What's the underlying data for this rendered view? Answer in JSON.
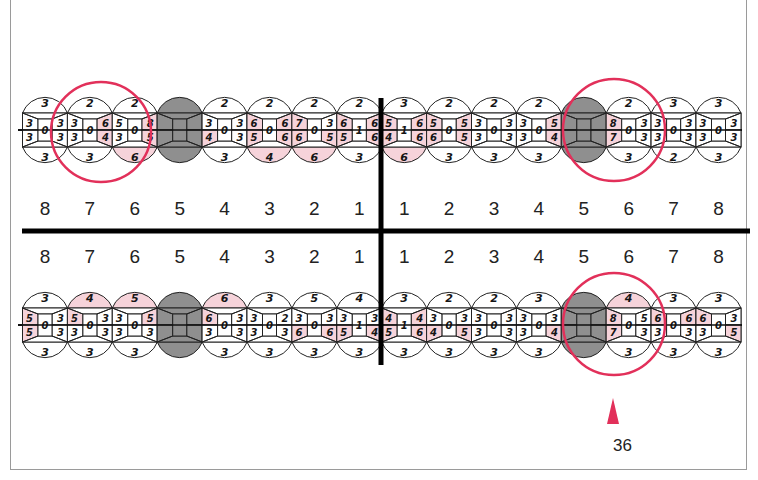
{
  "chart": {
    "type": "periodontal-chart",
    "tooth_numbers": [
      "8",
      "7",
      "6",
      "5",
      "4",
      "3",
      "2",
      "1",
      "1",
      "2",
      "3",
      "4",
      "5",
      "6",
      "7",
      "8"
    ],
    "highlight_color": "#f6d3da",
    "missing_color": "#8f8f8f",
    "circle_color": "#e2305a",
    "upper_row": {
      "teeth": [
        {
          "pos": "R8",
          "top": "3",
          "bottom": "3",
          "left_top": "3",
          "left_bottom": "3",
          "center": "0",
          "right_top": "3",
          "right_bottom": "3",
          "pink": []
        },
        {
          "pos": "R7",
          "top": "2",
          "bottom": "3",
          "left_top": "3",
          "left_bottom": "3",
          "center": "0",
          "right_top": "6",
          "right_bottom": "4",
          "pink": [
            "rt",
            "rb"
          ]
        },
        {
          "pos": "R6",
          "top": "2",
          "bottom": "6",
          "left_top": "5",
          "left_bottom": "3",
          "center": "0",
          "right_top": "8",
          "right_bottom": "5",
          "pink": [
            "rt",
            "rb",
            "b"
          ]
        },
        {
          "pos": "R5",
          "missing": true
        },
        {
          "pos": "R4",
          "top": "2",
          "bottom": "3",
          "left_top": "3",
          "left_bottom": "4",
          "center": "0",
          "right_top": "3",
          "right_bottom": "3",
          "pink": [
            "lb"
          ]
        },
        {
          "pos": "R3",
          "top": "2",
          "bottom": "4",
          "left_top": "6",
          "left_bottom": "5",
          "center": "0",
          "right_top": "6",
          "right_bottom": "6",
          "pink": [
            "lt",
            "lb",
            "rt",
            "rb",
            "b"
          ]
        },
        {
          "pos": "R2",
          "top": "2",
          "bottom": "6",
          "left_top": "7",
          "left_bottom": "6",
          "center": "0",
          "right_top": "3",
          "right_bottom": "5",
          "pink": [
            "lt",
            "lb",
            "rb",
            "b"
          ]
        },
        {
          "pos": "R1",
          "top": "2",
          "bottom": "3",
          "left_top": "6",
          "left_bottom": "5",
          "center": "1",
          "right_top": "6",
          "right_bottom": "6",
          "pink": [
            "lt",
            "lb",
            "rt",
            "rb"
          ]
        },
        {
          "pos": "L1",
          "top": "3",
          "bottom": "6",
          "left_top": "5",
          "left_bottom": "4",
          "center": "1",
          "right_top": "6",
          "right_bottom": "6",
          "pink": [
            "lt",
            "lb",
            "rt",
            "rb",
            "b"
          ]
        },
        {
          "pos": "L2",
          "top": "2",
          "bottom": "3",
          "left_top": "5",
          "left_bottom": "6",
          "center": "0",
          "right_top": "5",
          "right_bottom": "5",
          "pink": [
            "lt",
            "lb",
            "rt",
            "rb"
          ]
        },
        {
          "pos": "L3",
          "top": "2",
          "bottom": "3",
          "left_top": "3",
          "left_bottom": "3",
          "center": "0",
          "right_top": "3",
          "right_bottom": "3",
          "pink": []
        },
        {
          "pos": "L4",
          "top": "2",
          "bottom": "3",
          "left_top": "3",
          "left_bottom": "3",
          "center": "0",
          "right_top": "5",
          "right_bottom": "4",
          "pink": [
            "rt",
            "rb"
          ]
        },
        {
          "pos": "L5",
          "missing": true
        },
        {
          "pos": "L6",
          "top": "2",
          "bottom": "3",
          "left_top": "8",
          "left_bottom": "7",
          "center": "0",
          "right_top": "3",
          "right_bottom": "3",
          "pink": [
            "lt",
            "lb"
          ]
        },
        {
          "pos": "L7",
          "top": "3",
          "bottom": "2",
          "left_top": "3",
          "left_bottom": "3",
          "center": "0",
          "right_top": "3",
          "right_bottom": "3",
          "pink": []
        },
        {
          "pos": "L8",
          "top": "3",
          "bottom": "3",
          "left_top": "3",
          "left_bottom": "3",
          "center": "0",
          "right_top": "3",
          "right_bottom": "3",
          "pink": []
        }
      ],
      "circled": [
        "R7",
        "L5"
      ]
    },
    "lower_row": {
      "teeth": [
        {
          "pos": "R8",
          "top": "3",
          "bottom": "3",
          "left_top": "5",
          "left_bottom": "5",
          "center": "0",
          "right_top": "3",
          "right_bottom": "3",
          "pink": [
            "lt",
            "lb"
          ]
        },
        {
          "pos": "R7",
          "top": "4",
          "bottom": "3",
          "left_top": "5",
          "left_bottom": "3",
          "center": "0",
          "right_top": "3",
          "right_bottom": "3",
          "pink": [
            "t",
            "lt"
          ]
        },
        {
          "pos": "R6",
          "top": "5",
          "bottom": "3",
          "left_top": "3",
          "left_bottom": "3",
          "center": "0",
          "right_top": "5",
          "right_bottom": "3",
          "pink": [
            "t",
            "rt"
          ]
        },
        {
          "pos": "R5",
          "missing": true
        },
        {
          "pos": "R4",
          "top": "6",
          "bottom": "3",
          "left_top": "6",
          "left_bottom": "3",
          "center": "0",
          "right_top": "3",
          "right_bottom": "3",
          "pink": [
            "t",
            "lt"
          ]
        },
        {
          "pos": "R3",
          "top": "3",
          "bottom": "3",
          "left_top": "3",
          "left_bottom": "3",
          "center": "0",
          "right_top": "2",
          "right_bottom": "3",
          "pink": []
        },
        {
          "pos": "R2",
          "top": "5",
          "bottom": "3",
          "left_top": "3",
          "left_bottom": "6",
          "center": "0",
          "right_top": "3",
          "right_bottom": "6",
          "pink": [
            "lb",
            "rb"
          ]
        },
        {
          "pos": "R1",
          "top": "4",
          "bottom": "3",
          "left_top": "3",
          "left_bottom": "5",
          "center": "1",
          "right_top": "3",
          "right_bottom": "4",
          "pink": [
            "lb",
            "rb"
          ]
        },
        {
          "pos": "L1",
          "top": "3",
          "bottom": "3",
          "left_top": "4",
          "left_bottom": "5",
          "center": "1",
          "right_top": "4",
          "right_bottom": "6",
          "pink": [
            "lt",
            "lb",
            "rt",
            "rb"
          ]
        },
        {
          "pos": "L2",
          "top": "2",
          "bottom": "3",
          "left_top": "3",
          "left_bottom": "4",
          "center": "0",
          "right_top": "3",
          "right_bottom": "5",
          "pink": [
            "lb",
            "rb"
          ]
        },
        {
          "pos": "L3",
          "top": "2",
          "bottom": "3",
          "left_top": "3",
          "left_bottom": "3",
          "center": "0",
          "right_top": "3",
          "right_bottom": "3",
          "pink": []
        },
        {
          "pos": "L4",
          "top": "3",
          "bottom": "3",
          "left_top": "3",
          "left_bottom": "3",
          "center": "0",
          "right_top": "3",
          "right_bottom": "4",
          "pink": [
            "rb"
          ]
        },
        {
          "pos": "L5",
          "missing": true
        },
        {
          "pos": "L6",
          "top": "4",
          "bottom": "3",
          "left_top": "8",
          "left_bottom": "7",
          "center": "0",
          "right_top": "5",
          "right_bottom": "3",
          "pink": [
            "t",
            "lt",
            "lb"
          ]
        },
        {
          "pos": "L7",
          "top": "3",
          "bottom": "3",
          "left_top": "6",
          "left_bottom": "3",
          "center": "0",
          "right_top": "6",
          "right_bottom": "3",
          "pink": [
            "lt",
            "rt"
          ]
        },
        {
          "pos": "L8",
          "top": "3",
          "bottom": "3",
          "left_top": "6",
          "left_bottom": "3",
          "center": "0",
          "right_top": "3",
          "right_bottom": "5",
          "pink": [
            "lt",
            "rb"
          ]
        }
      ],
      "circled": [
        "L5"
      ]
    },
    "marker": {
      "label": "36",
      "color": "#e2305a"
    }
  }
}
